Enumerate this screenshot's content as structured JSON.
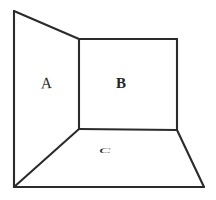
{
  "figure": {
    "background_color": "#ffffff",
    "line_color": "#2b2b2b",
    "line_width": 2.1,
    "canvas": {
      "width": 216,
      "height": 200
    }
  },
  "labels": {
    "panel_a": "A",
    "panel_b": "B",
    "panel_c": "C"
  },
  "surfaces": [
    {
      "name": "left-wall",
      "label": "A",
      "description": "left side wall receding away from viewer",
      "vertices": [
        [
          14,
          11
        ],
        [
          79,
          39
        ],
        [
          79,
          129
        ],
        [
          14,
          187
        ]
      ]
    },
    {
      "name": "back-wall",
      "label": "B",
      "description": "rear wall facing the viewer",
      "vertices": [
        [
          79,
          39
        ],
        [
          177,
          39
        ],
        [
          177,
          130
        ],
        [
          79,
          129
        ]
      ]
    },
    {
      "name": "floor",
      "label": "C",
      "description": "floor plane receding toward the back wall",
      "vertices": [
        [
          14,
          187
        ],
        [
          79,
          129
        ],
        [
          177,
          130
        ],
        [
          204,
          187
        ]
      ]
    }
  ],
  "edges": [
    {
      "name": "left-wall-outer-vertical",
      "from": [
        14,
        11
      ],
      "to": [
        14,
        187
      ]
    },
    {
      "name": "left-wall-top-receding",
      "from": [
        14,
        11
      ],
      "to": [
        79,
        39
      ]
    },
    {
      "name": "wall-corner-vertical",
      "from": [
        79,
        39
      ],
      "to": [
        79,
        129
      ]
    },
    {
      "name": "back-wall-top",
      "from": [
        79,
        39
      ],
      "to": [
        177,
        39
      ]
    },
    {
      "name": "back-wall-right-vertical",
      "from": [
        177,
        39
      ],
      "to": [
        177,
        130
      ]
    },
    {
      "name": "floor-back-edge",
      "from": [
        79,
        129
      ],
      "to": [
        177,
        130
      ]
    },
    {
      "name": "floor-left-diagonal",
      "from": [
        79,
        129
      ],
      "to": [
        14,
        187
      ]
    },
    {
      "name": "floor-right-diagonal",
      "from": [
        177,
        130
      ],
      "to": [
        204,
        187
      ]
    },
    {
      "name": "floor-front-edge",
      "from": [
        14,
        187
      ],
      "to": [
        204,
        187
      ]
    }
  ],
  "label_positions": {
    "panel_a": [
      48,
      84
    ],
    "panel_b": [
      122,
      85
    ],
    "panel_c": [
      109,
      153
    ]
  }
}
